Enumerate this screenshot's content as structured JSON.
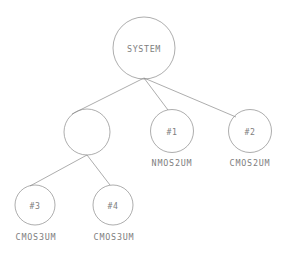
{
  "diagram": {
    "type": "tree",
    "background_color": "#ffffff",
    "stroke_color": "#8a8a8a",
    "text_color": "#7e7e7e",
    "nodes": [
      {
        "id": "root",
        "label": "SYSTEM",
        "caption": "",
        "cx": 144,
        "cy": 48,
        "r": 31,
        "level": 0
      },
      {
        "id": "group",
        "label": "",
        "caption": "",
        "cx": 87,
        "cy": 132,
        "r": 23,
        "level": 1
      },
      {
        "id": "n1",
        "label": "#1",
        "caption": "NMOS2UM",
        "cx": 172,
        "cy": 131,
        "r": 21.5,
        "level": 1
      },
      {
        "id": "n2",
        "label": "#2",
        "caption": "CMOS2UM",
        "cx": 250,
        "cy": 131,
        "r": 21.5,
        "level": 1
      },
      {
        "id": "n3",
        "label": "#3",
        "caption": "CMOS3UM",
        "cx": 35,
        "cy": 205,
        "r": 20,
        "level": 2
      },
      {
        "id": "n4",
        "label": "#4",
        "caption": "CMOS3UM",
        "cx": 113,
        "cy": 205,
        "r": 20,
        "level": 2
      }
    ],
    "edges": [
      {
        "id": "root-group",
        "from": "root",
        "to": "group",
        "x1": 144,
        "y1": 78,
        "x2": 72,
        "y2": 114
      },
      {
        "id": "root-n1",
        "from": "root",
        "to": "n1",
        "x1": 144,
        "y1": 78,
        "x2": 168,
        "y2": 110
      },
      {
        "id": "root-n2",
        "from": "root",
        "to": "n2",
        "x1": 144,
        "y1": 78,
        "x2": 236,
        "y2": 117
      },
      {
        "id": "group-n3",
        "from": "group",
        "to": "n3",
        "x1": 87,
        "y1": 155,
        "x2": 30,
        "y2": 186
      },
      {
        "id": "group-n4",
        "from": "group",
        "to": "n4",
        "x1": 87,
        "y1": 155,
        "x2": 110,
        "y2": 185
      }
    ],
    "captions": [
      {
        "id": "cap-n1",
        "text": "NMOS2UM",
        "x": 172,
        "y": 166
      },
      {
        "id": "cap-n2",
        "text": "CMOS2UM",
        "x": 250,
        "y": 166
      },
      {
        "id": "cap-n3",
        "text": "CMOS3UM",
        "x": 36,
        "y": 240
      },
      {
        "id": "cap-n4",
        "text": "CMOS3UM",
        "x": 114,
        "y": 240
      }
    ]
  }
}
